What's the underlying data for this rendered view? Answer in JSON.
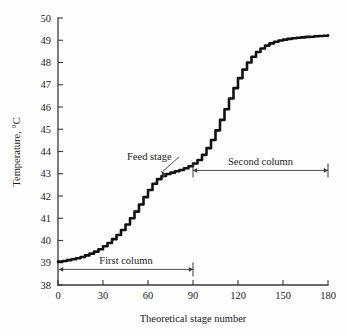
{
  "chart_data": {
    "type": "line",
    "title": "",
    "xlabel": "Theoretical stage number",
    "ylabel": "Temperature, °C",
    "xlim": [
      0,
      180
    ],
    "ylim": [
      38,
      50
    ],
    "grid": false,
    "legend": "none",
    "xticks": [
      0,
      30,
      60,
      90,
      120,
      150,
      180
    ],
    "xtick_labels": [
      "0",
      "30",
      "60",
      "90",
      "120",
      "150",
      "180"
    ],
    "yticks": [
      38,
      39,
      40,
      41,
      42,
      43,
      44,
      45,
      46,
      47,
      48,
      49,
      50
    ],
    "ytick_labels": [
      "38",
      "39",
      "40",
      "41",
      "42",
      "43",
      "44",
      "45",
      "46",
      "47",
      "48",
      "49",
      "50"
    ],
    "series": [
      {
        "name": "Temperature profile",
        "x": [
          0,
          3,
          6,
          9,
          12,
          15,
          18,
          21,
          24,
          27,
          30,
          33,
          36,
          39,
          42,
          45,
          48,
          51,
          54,
          57,
          60,
          63,
          66,
          69,
          72,
          75,
          78,
          81,
          84,
          87,
          90,
          93,
          96,
          99,
          102,
          105,
          108,
          111,
          114,
          117,
          120,
          123,
          126,
          129,
          132,
          135,
          138,
          141,
          144,
          147,
          150,
          153,
          156,
          159,
          162,
          165,
          168,
          171,
          174,
          177,
          180
        ],
        "y": [
          39.05,
          39.08,
          39.12,
          39.16,
          39.2,
          39.26,
          39.33,
          39.41,
          39.5,
          39.61,
          39.74,
          39.89,
          40.06,
          40.25,
          40.47,
          40.72,
          41.0,
          41.3,
          41.62,
          41.95,
          42.27,
          42.55,
          42.76,
          42.9,
          42.99,
          43.05,
          43.11,
          43.17,
          43.25,
          43.34,
          43.46,
          43.62,
          43.85,
          44.15,
          44.52,
          44.95,
          45.42,
          45.9,
          46.38,
          46.85,
          47.3,
          47.68,
          48.0,
          48.26,
          48.47,
          48.63,
          48.76,
          48.86,
          48.93,
          48.99,
          49.03,
          49.06,
          49.09,
          49.11,
          49.13,
          49.15,
          49.16,
          49.18,
          49.19,
          49.2,
          49.22
        ]
      }
    ],
    "annotations": [
      {
        "name": "feed-stage",
        "label": "Feed stage",
        "label_x": 46,
        "label_y": 43.6,
        "point_x": 72,
        "point_y": 42.98
      },
      {
        "name": "first-column-span",
        "label": "First column",
        "from_x": 0,
        "to_x": 90,
        "y": 38.7
      },
      {
        "name": "second-column-span",
        "label": "Second column",
        "from_x": 90,
        "to_x": 180,
        "y": 43.15
      }
    ]
  }
}
